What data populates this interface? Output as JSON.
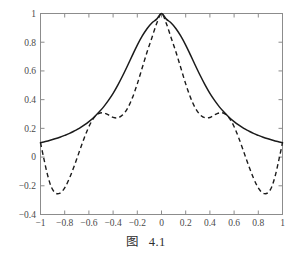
{
  "caption": {
    "prefix": "图",
    "number": "4.1"
  },
  "chart_data": {
    "type": "line",
    "title": "",
    "xlabel": "",
    "ylabel": "",
    "xlim": [
      -1,
      1
    ],
    "ylim": [
      -0.4,
      1
    ],
    "grid": false,
    "legend": "none",
    "xticks": [
      -1,
      -0.8,
      -0.6,
      -0.4,
      -0.2,
      0,
      0.2,
      0.4,
      0.6,
      0.8,
      1
    ],
    "xticklabels": [
      "−1",
      "−0.8",
      "−0.6",
      "−0.4",
      "−0.2",
      "0",
      "0.2",
      "0.4",
      "0.6",
      "0.8",
      "1"
    ],
    "yticks": [
      -0.4,
      -0.2,
      0,
      0.2,
      0.4,
      0.6,
      0.8,
      1
    ],
    "yticklabels": [
      "−0.4",
      "−0.2",
      "0",
      "0.2",
      "0.4",
      "0.6",
      "0.8",
      "1"
    ],
    "series": [
      {
        "name": "runge-function-solid",
        "style": "solid",
        "color": "#1b1b1b",
        "x": [
          -1,
          -0.96,
          -0.92,
          -0.88,
          -0.84,
          -0.8,
          -0.76,
          -0.72,
          -0.68,
          -0.64,
          -0.6,
          -0.56,
          -0.52,
          -0.48,
          -0.44,
          -0.4,
          -0.36,
          -0.32,
          -0.28,
          -0.24,
          -0.2,
          -0.16,
          -0.12,
          -0.08,
          -0.04,
          0,
          0.04,
          0.08,
          0.12,
          0.16,
          0.2,
          0.24,
          0.28,
          0.32,
          0.36,
          0.4,
          0.44,
          0.48,
          0.52,
          0.56,
          0.6,
          0.64,
          0.68,
          0.72,
          0.76,
          0.8,
          0.84,
          0.88,
          0.92,
          0.96,
          1
        ],
        "y": [
          0.1,
          0.108,
          0.117,
          0.127,
          0.138,
          0.151,
          0.165,
          0.182,
          0.2,
          0.222,
          0.247,
          0.276,
          0.31,
          0.348,
          0.393,
          0.444,
          0.503,
          0.568,
          0.638,
          0.71,
          0.78,
          0.842,
          0.894,
          0.934,
          0.961,
          1.0,
          0.961,
          0.934,
          0.894,
          0.842,
          0.78,
          0.71,
          0.638,
          0.568,
          0.503,
          0.444,
          0.393,
          0.348,
          0.31,
          0.276,
          0.247,
          0.222,
          0.2,
          0.182,
          0.165,
          0.151,
          0.138,
          0.127,
          0.117,
          0.108,
          0.1
        ]
      },
      {
        "name": "polynomial-interpolant-dashed",
        "style": "dashed",
        "color": "#1b1b1b",
        "x": [
          -1,
          -0.97,
          -0.94,
          -0.91,
          -0.88,
          -0.85,
          -0.82,
          -0.79,
          -0.76,
          -0.73,
          -0.7,
          -0.67,
          -0.64,
          -0.61,
          -0.58,
          -0.55,
          -0.52,
          -0.49,
          -0.46,
          -0.43,
          -0.4,
          -0.36,
          -0.32,
          -0.28,
          -0.24,
          -0.2,
          -0.16,
          -0.12,
          -0.08,
          -0.04,
          0,
          0.04,
          0.08,
          0.12,
          0.16,
          0.2,
          0.24,
          0.28,
          0.32,
          0.36,
          0.4,
          0.43,
          0.46,
          0.49,
          0.52,
          0.55,
          0.58,
          0.61,
          0.64,
          0.67,
          0.7,
          0.73,
          0.76,
          0.79,
          0.82,
          0.85,
          0.88,
          0.91,
          0.94,
          0.97,
          1
        ],
        "y": [
          0.1,
          -0.02,
          -0.13,
          -0.21,
          -0.248,
          -0.255,
          -0.238,
          -0.2,
          -0.146,
          -0.082,
          -0.012,
          0.06,
          0.13,
          0.193,
          0.245,
          0.282,
          0.303,
          0.309,
          0.303,
          0.29,
          0.276,
          0.274,
          0.294,
          0.34,
          0.414,
          0.51,
          0.62,
          0.73,
          0.83,
          0.93,
          1.0,
          0.93,
          0.83,
          0.73,
          0.62,
          0.51,
          0.414,
          0.34,
          0.294,
          0.274,
          0.276,
          0.29,
          0.303,
          0.309,
          0.303,
          0.282,
          0.245,
          0.193,
          0.13,
          0.06,
          -0.012,
          -0.082,
          -0.146,
          -0.2,
          -0.238,
          -0.255,
          -0.248,
          -0.21,
          -0.13,
          -0.02,
          0.1
        ]
      }
    ]
  }
}
